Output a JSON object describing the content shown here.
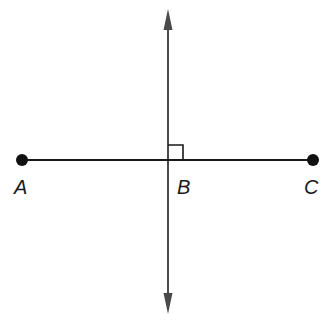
{
  "diagram": {
    "type": "geometry",
    "colors": {
      "segment": "#1a1a1a",
      "perpendicular": "#4a4a4a",
      "points": "#111111"
    },
    "points": [
      {
        "id": "A",
        "label": "A",
        "x": 22,
        "y": 160
      },
      {
        "id": "B",
        "label": "B",
        "x": 168,
        "y": 160
      },
      {
        "id": "C",
        "label": "C",
        "x": 313,
        "y": 160
      }
    ],
    "segment": {
      "from": "A",
      "to": "C"
    },
    "perpendicular_line": {
      "through": "B",
      "x": 168,
      "y_top": 10,
      "y_bottom": 313,
      "arrows": "both"
    },
    "right_angle_marker": {
      "at": "B",
      "size": 15
    }
  }
}
